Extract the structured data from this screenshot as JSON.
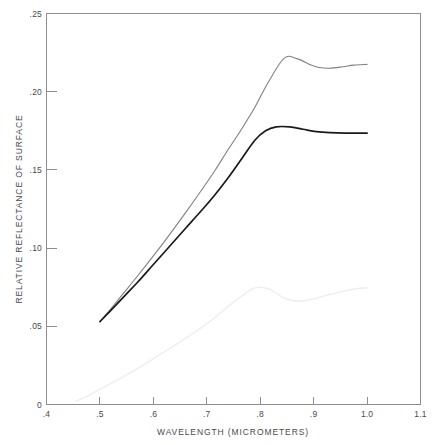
{
  "chart_data": {
    "type": "line",
    "title": "",
    "xlabel": "WAVELENGTH (MICROMETERS)",
    "ylabel": "RELATIVE REFLECTANCE OF SURFACE",
    "xlim": [
      0.4,
      1.1
    ],
    "ylim": [
      0.0,
      0.25
    ],
    "grid": false,
    "legend": "none",
    "xticks": [
      0.4,
      0.5,
      0.6,
      0.7,
      0.8,
      0.9,
      1.0,
      1.1
    ],
    "xticklabels": [
      ".4",
      ".5",
      ".6",
      ".7",
      ".8",
      ".9",
      "1.0",
      "1.1"
    ],
    "yticks": [
      0.0,
      0.05,
      0.1,
      0.15,
      0.2,
      0.25
    ],
    "yticklabels": [
      "0",
      ".05",
      ".10",
      ".15",
      ".20",
      ".25"
    ],
    "series": [
      {
        "name": "upper-curve",
        "color": "#808080",
        "width": 1.1,
        "x": [
          0.5,
          0.52,
          0.545,
          0.57,
          0.6,
          0.63,
          0.66,
          0.69,
          0.715,
          0.74,
          0.765,
          0.79,
          0.815,
          0.845,
          0.87,
          0.895,
          0.91,
          0.93,
          0.955,
          0.975,
          1.0
        ],
        "y": [
          0.053,
          0.061,
          0.0715,
          0.082,
          0.095,
          0.1085,
          0.1225,
          0.137,
          0.1495,
          0.163,
          0.176,
          0.19,
          0.206,
          0.2215,
          0.221,
          0.217,
          0.2155,
          0.215,
          0.216,
          0.217,
          0.2175
        ]
      },
      {
        "name": "middle-curve",
        "color": "#1a1a1a",
        "width": 1.7,
        "x": [
          0.5,
          0.52,
          0.545,
          0.57,
          0.6,
          0.63,
          0.66,
          0.69,
          0.715,
          0.74,
          0.765,
          0.79,
          0.81,
          0.83,
          0.855,
          0.88,
          0.905,
          0.93,
          0.96,
          1.0
        ],
        "y": [
          0.053,
          0.06,
          0.069,
          0.078,
          0.0895,
          0.101,
          0.1125,
          0.124,
          0.134,
          0.145,
          0.157,
          0.169,
          0.175,
          0.1775,
          0.1775,
          0.176,
          0.1745,
          0.1738,
          0.1735,
          0.1735
        ]
      },
      {
        "name": "lower-curve",
        "color": "#eeeeee",
        "width": 1.4,
        "x": [
          0.455,
          0.48,
          0.51,
          0.545,
          0.58,
          0.615,
          0.65,
          0.685,
          0.715,
          0.745,
          0.77,
          0.79,
          0.815,
          0.84,
          0.86,
          0.885,
          0.915,
          0.95,
          0.98,
          1.0
        ],
        "y": [
          0.002,
          0.006,
          0.0115,
          0.018,
          0.025,
          0.0325,
          0.04,
          0.048,
          0.0555,
          0.064,
          0.0705,
          0.0745,
          0.074,
          0.069,
          0.0665,
          0.0665,
          0.069,
          0.072,
          0.074,
          0.0745
        ]
      }
    ]
  },
  "axis": {
    "x_title": "WAVELENGTH (MICROMETERS)",
    "y_title": "RELATIVE REFLECTANCE OF SURFACE"
  },
  "colors": {
    "frame": "#8e8e8e",
    "text": "#4a4a4a",
    "upper_series": "#808080",
    "middle_series": "#1a1a1a",
    "lower_series": "#eeeeee",
    "background": "#ffffff"
  }
}
